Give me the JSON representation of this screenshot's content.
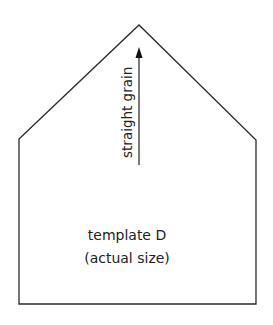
{
  "diagram": {
    "shape": "pentagon-house",
    "vertices": [
      [
        19,
        139
      ],
      [
        139,
        25
      ],
      [
        256,
        140
      ],
      [
        256,
        304
      ],
      [
        19,
        304
      ]
    ],
    "stroke_color": "#2a2a2a",
    "grain_arrow": {
      "label": "straight grain",
      "x": 139,
      "y_start": 165,
      "y_end": 48
    },
    "title": "template D",
    "subtitle": "(actual size)"
  }
}
